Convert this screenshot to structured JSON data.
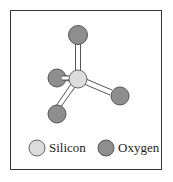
{
  "diagram": {
    "title": "",
    "atoms": [
      {
        "id": "si",
        "element": "Silicon",
        "cx": 78,
        "cy": 79,
        "r": 9,
        "color": "#dcdcdc"
      },
      {
        "id": "o1",
        "element": "Oxygen",
        "cx": 78,
        "cy": 35,
        "r": 9.5,
        "color": "#8e8e8e"
      },
      {
        "id": "o2",
        "element": "Oxygen",
        "cx": 57,
        "cy": 78,
        "r": 9,
        "color": "#8e8e8e"
      },
      {
        "id": "o3",
        "element": "Oxygen",
        "cx": 120,
        "cy": 96,
        "r": 9,
        "color": "#8e8e8e"
      },
      {
        "id": "o4",
        "element": "Oxygen",
        "cx": 57,
        "cy": 114,
        "r": 9,
        "color": "#8e8e8e"
      }
    ],
    "bonds": [
      [
        "si",
        "o1"
      ],
      [
        "si",
        "o2"
      ],
      [
        "si",
        "o3"
      ],
      [
        "si",
        "o4"
      ]
    ]
  },
  "legend": {
    "items": [
      {
        "label": "Silicon",
        "color": "#dcdcdc"
      },
      {
        "label": "Oxygen",
        "color": "#8e8e8e"
      }
    ]
  }
}
